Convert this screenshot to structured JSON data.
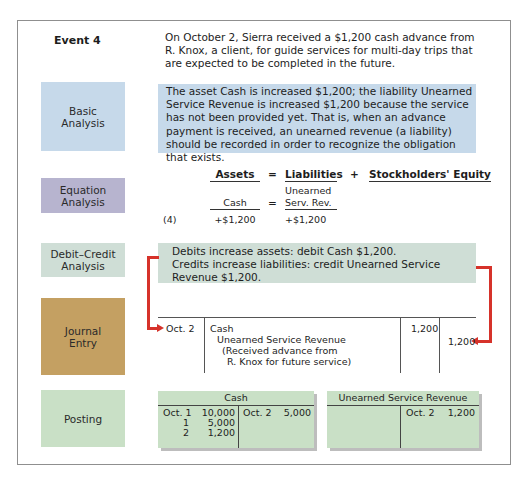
{
  "event": {
    "title": "Event 4",
    "text": "On October 2, Sierra received a $1,200 cash advance from R. Knox, a client, for guide services for multi-day trips that are expected to be completed in the future."
  },
  "labels": {
    "basic_analysis": "Basic Analysis",
    "equation_analysis": "Equation Analysis",
    "debit_credit_analysis": "Debit–Credit Analysis",
    "journal_entry": "Journal Entry",
    "posting": "Posting"
  },
  "basic_analysis": {
    "text": "The asset Cash is increased $1,200; the liability Unearned Service Revenue is increased $1,200 because the service has not been provided yet. That is, when an advance payment is received, an unearned revenue (a liability) should be recorded in order to recognize the obligation that exists."
  },
  "equation": {
    "headers": {
      "assets": "Assets",
      "eq": "=",
      "liabilities": "Liabilities",
      "plus": "+",
      "equity": "Stockholders' Equity"
    },
    "sub": {
      "assets": "Cash",
      "eq": "=",
      "liab_line1": "Unearned",
      "liab_line2": "Serv. Rev."
    },
    "row": {
      "ref": "(4)",
      "assets": "+$1,200",
      "liabilities": "+$1,200"
    }
  },
  "debit_credit": {
    "line1": "Debits increase assets: debit Cash $1,200.",
    "line2": "Credits increase liabilities: credit Unearned Service",
    "line3": "Revenue $1,200."
  },
  "journal": {
    "date": "Oct. 2",
    "debit_account": "Cash",
    "credit_account": "Unearned Service Revenue",
    "memo_line1": "(Received advance from",
    "memo_line2": "R. Knox for future service)",
    "debit_amount": "1,200",
    "credit_amount": "1,200"
  },
  "posting": {
    "cash": {
      "title": "Cash",
      "debits": [
        {
          "date": "Oct. 1",
          "amount": "10,000"
        },
        {
          "date": "1",
          "amount": "5,000"
        },
        {
          "date": "2",
          "amount": "1,200"
        }
      ],
      "credits": [
        {
          "date": "Oct. 2",
          "amount": "5,000"
        }
      ]
    },
    "unearned": {
      "title": "Unearned Service Revenue",
      "debits": [],
      "credits": [
        {
          "date": "Oct. 2",
          "amount": "1,200"
        }
      ]
    }
  },
  "colors": {
    "basic": "#c6d9ea",
    "equation": "#b7b4cf",
    "debit_credit": "#cfded6",
    "journal": "#c4a062",
    "posting": "#c9e0c6",
    "arrow": "#d6322a"
  }
}
